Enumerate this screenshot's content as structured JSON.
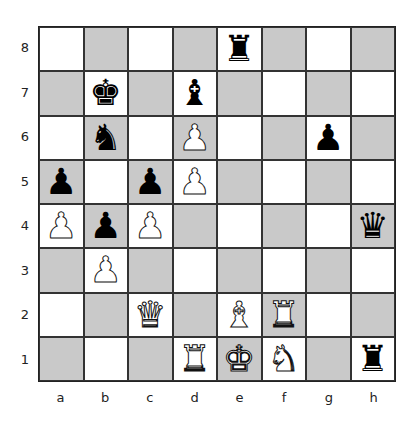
{
  "board": {
    "ranks": [
      "8",
      "7",
      "6",
      "5",
      "4",
      "3",
      "2",
      "1"
    ],
    "files": [
      "a",
      "b",
      "c",
      "d",
      "e",
      "f",
      "g",
      "h"
    ],
    "colors": {
      "light": "#ffffff",
      "dark": "#c9c9c9"
    },
    "pieces": [
      {
        "square": "e8",
        "color": "black",
        "type": "rook",
        "glyph": "♜"
      },
      {
        "square": "b7",
        "color": "black",
        "type": "king",
        "glyph": "♚"
      },
      {
        "square": "d7",
        "color": "black",
        "type": "bishop",
        "glyph": "♝"
      },
      {
        "square": "b6",
        "color": "black",
        "type": "knight",
        "glyph": "♞"
      },
      {
        "square": "d6",
        "color": "white",
        "type": "pawn",
        "glyph": "♟"
      },
      {
        "square": "g6",
        "color": "black",
        "type": "pawn",
        "glyph": "♟"
      },
      {
        "square": "a5",
        "color": "black",
        "type": "pawn",
        "glyph": "♟"
      },
      {
        "square": "c5",
        "color": "black",
        "type": "pawn",
        "glyph": "♟"
      },
      {
        "square": "d5",
        "color": "white",
        "type": "pawn",
        "glyph": "♟"
      },
      {
        "square": "a4",
        "color": "white",
        "type": "pawn",
        "glyph": "♟"
      },
      {
        "square": "b4",
        "color": "black",
        "type": "pawn",
        "glyph": "♟"
      },
      {
        "square": "c4",
        "color": "white",
        "type": "pawn",
        "glyph": "♟"
      },
      {
        "square": "h4",
        "color": "black",
        "type": "queen",
        "glyph": "♛"
      },
      {
        "square": "b3",
        "color": "white",
        "type": "pawn",
        "glyph": "♟"
      },
      {
        "square": "c2",
        "color": "white",
        "type": "queen",
        "glyph": "♛"
      },
      {
        "square": "e2",
        "color": "white",
        "type": "bishop",
        "glyph": "♝"
      },
      {
        "square": "f2",
        "color": "white",
        "type": "rook",
        "glyph": "♜"
      },
      {
        "square": "d1",
        "color": "white",
        "type": "rook",
        "glyph": "♜"
      },
      {
        "square": "e1",
        "color": "white",
        "type": "king",
        "glyph": "♚"
      },
      {
        "square": "f1",
        "color": "white",
        "type": "knight",
        "glyph": "♞"
      },
      {
        "square": "h1",
        "color": "black",
        "type": "rook",
        "glyph": "♜"
      }
    ]
  }
}
